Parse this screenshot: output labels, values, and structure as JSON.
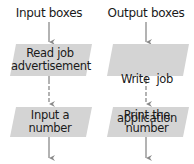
{
  "columns": [
    {
      "heading": "Input boxes",
      "boxes": [
        {
          "line1": "Read job",
          "line2": "advertisement"
        },
        {
          "line1": "Input a",
          "line2": "number"
        }
      ]
    },
    {
      "heading": "Output boxes",
      "boxes": [
        {
          "line1": "Write  job",
          "line2": "application"
        },
        {
          "line1": "Print the",
          "line2": "number"
        }
      ]
    }
  ],
  "colors": {
    "box_fill": "#d4d4d4",
    "arrow": "#8a8a8a",
    "text": "#1a1a1a"
  }
}
